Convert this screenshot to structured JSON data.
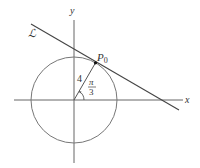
{
  "diagram": {
    "title": "",
    "axes": {
      "x_label": "x",
      "y_label": "y"
    },
    "circle": {
      "center": "origin",
      "radius_label": "4"
    },
    "line": {
      "label": "ℒ",
      "description": "tangent line to circle at P0"
    },
    "point": {
      "label_main": "P",
      "label_sub": "0"
    },
    "angle": {
      "numerator": "π",
      "denominator": "3"
    },
    "colors": {
      "stroke": "#555555",
      "text": "#333333",
      "background": "#ffffff"
    }
  }
}
